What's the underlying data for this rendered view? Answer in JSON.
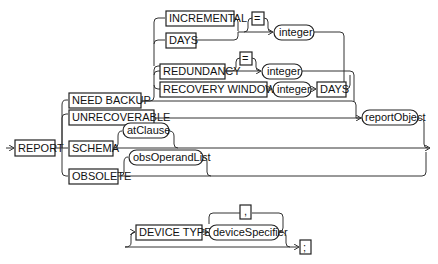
{
  "diagram": {
    "type": "railroad-syntax",
    "main": {
      "start": "REPORT",
      "need_backup": {
        "keyword": "NEED BACKUP",
        "options": {
          "incremental": "INCREMENTAL",
          "days": "DAYS",
          "eq1": "=",
          "int1": "integer",
          "redundancy": "REDUNDANCY",
          "eq2": "=",
          "int2": "integer",
          "recovery": "RECOVERY WINDOW OF",
          "int3": "integer",
          "days2": "DAYS"
        }
      },
      "unrecoverable": "UNRECOVERABLE",
      "report_object": "reportObject",
      "schema": "SCHEMA",
      "at_clause": "atClause",
      "obsolete": "OBSOLETE",
      "obs_operand": "obsOperandList"
    },
    "sub": {
      "device_type": "DEVICE TYPE",
      "comma": ",",
      "device_specifier": "deviceSpecifier",
      "semicolon": ";"
    }
  }
}
